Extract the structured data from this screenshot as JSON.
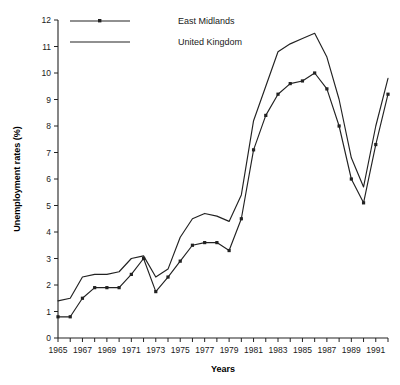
{
  "chart_data": {
    "type": "line",
    "title": "",
    "xlabel": "Years",
    "ylabel": "Unemployment rates (%)",
    "xlim": [
      1965,
      1992
    ],
    "ylim": [
      0,
      12
    ],
    "ytick_step": 1,
    "xtick_step": 1,
    "xtick_label_step": 2,
    "grid": false,
    "legend_position": "top-left",
    "yticks": [
      "0",
      "1",
      "2",
      "3",
      "4",
      "5",
      "6",
      "7",
      "8",
      "9",
      "10",
      "11",
      "12"
    ],
    "xticks": [
      "1965",
      "1967",
      "1969",
      "1971",
      "1973",
      "1975",
      "1977",
      "1979",
      "1981",
      "1983",
      "1985",
      "1987",
      "1989",
      "1991"
    ],
    "x": [
      1965,
      1966,
      1967,
      1968,
      1969,
      1970,
      1971,
      1972,
      1973,
      1974,
      1975,
      1976,
      1977,
      1978,
      1979,
      1980,
      1981,
      1982,
      1983,
      1984,
      1985,
      1986,
      1987,
      1988,
      1989,
      1990,
      1991,
      1992
    ],
    "series": [
      {
        "name": "East Midlands",
        "marker": "square",
        "values": [
          0.8,
          0.8,
          1.5,
          1.9,
          1.9,
          1.9,
          2.4,
          3.0,
          1.75,
          2.3,
          2.9,
          3.5,
          3.6,
          3.6,
          3.3,
          4.5,
          7.1,
          8.4,
          9.2,
          9.6,
          9.7,
          10.0,
          9.4,
          8.0,
          6.0,
          5.1,
          7.3,
          9.2
        ]
      },
      {
        "name": "United Kingdom",
        "marker": "none",
        "values": [
          1.4,
          1.5,
          2.3,
          2.4,
          2.4,
          2.5,
          3.0,
          3.1,
          2.3,
          2.6,
          3.8,
          4.5,
          4.7,
          4.6,
          4.4,
          5.4,
          8.2,
          9.5,
          10.8,
          11.1,
          11.3,
          11.5,
          10.6,
          9.0,
          6.8,
          5.7,
          8.0,
          9.8
        ]
      }
    ]
  },
  "legend": {
    "items": [
      {
        "label": "East Midlands"
      },
      {
        "label": "United Kingdom"
      }
    ]
  },
  "colors": {
    "line": "#222222",
    "axis": "#222222",
    "background": "#ffffff"
  }
}
